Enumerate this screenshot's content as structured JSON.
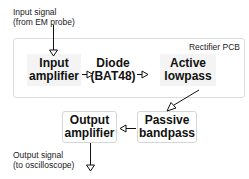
{
  "input_label": {
    "line1": "Input signal",
    "line2": "(from EM probe)"
  },
  "output_label": {
    "line1": "Output signal",
    "line2": "(to oscilloscope)"
  },
  "pcb": {
    "label": "Rectifier PCB"
  },
  "blocks": [
    {
      "id": "input-amplifier",
      "line1": "Input",
      "line2": "amplifier"
    },
    {
      "id": "diode",
      "line1": "Diode",
      "line2": "(BAT48)"
    },
    {
      "id": "active-lowpass",
      "line1": "Active",
      "line2": "lowpass"
    },
    {
      "id": "passive-bandpass",
      "line1": "Passive",
      "line2": "bandpass"
    },
    {
      "id": "output-amplifier",
      "line1": "Output",
      "line2": "amplifier"
    }
  ],
  "colors": {
    "pcb_border": "#dcdcdc",
    "block_border": "#d6d6d6",
    "arrow": "#111111",
    "text": "#111111"
  }
}
